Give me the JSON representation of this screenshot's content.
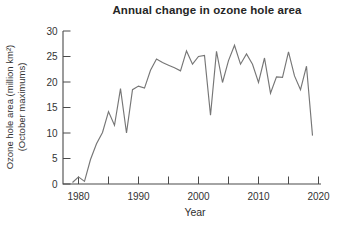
{
  "chart_data": {
    "type": "line",
    "title": "Annual change in ozone hole area",
    "xlabel": "Year",
    "ylabel": "Ozone hole area (million km²)",
    "ylabel_line2": "(October maximums)",
    "x": [
      1979,
      1980,
      1981,
      1982,
      1983,
      1984,
      1985,
      1986,
      1987,
      1988,
      1989,
      1990,
      1991,
      1992,
      1993,
      1994,
      1995,
      1996,
      1997,
      1998,
      1999,
      2000,
      2001,
      2002,
      2003,
      2004,
      2005,
      2006,
      2007,
      2008,
      2009,
      2010,
      2011,
      2012,
      2013,
      2014,
      2015,
      2016,
      2017,
      2018,
      2019
    ],
    "values": [
      0.3,
      1.4,
      0.5,
      4.8,
      7.9,
      10.1,
      14.2,
      11.5,
      18.7,
      10.0,
      18.5,
      19.2,
      18.8,
      22.3,
      24.5,
      23.8,
      23.3,
      22.8,
      22.2,
      26.1,
      23.5,
      25.0,
      25.2,
      13.5,
      26.0,
      19.9,
      24.2,
      27.2,
      23.5,
      25.5,
      23.5,
      19.9,
      24.7,
      17.8,
      21.0,
      20.9,
      25.9,
      21.2,
      18.5,
      23.1,
      9.5
    ],
    "xlim": [
      1977.5,
      2020.5
    ],
    "ylim": [
      0,
      30
    ],
    "y_ticks": [
      "0",
      "5",
      "10",
      "15",
      "20",
      "25",
      "30"
    ],
    "x_major_ticks": [
      "1980",
      "1990",
      "2000",
      "2010",
      "2020"
    ],
    "x_minor_ticks": [
      "1985",
      "1995",
      "2005",
      "2015"
    ],
    "grid": false,
    "legend": "none",
    "line_color": "#767676",
    "axis_color": "#4a4a4a",
    "text_color": "#333333"
  }
}
